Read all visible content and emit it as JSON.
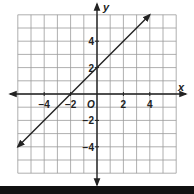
{
  "chart_data": {
    "type": "line",
    "title": "",
    "xlabel": "x",
    "ylabel": "y",
    "xlim": [
      -6,
      6
    ],
    "ylim": [
      -6,
      6
    ],
    "grid": true,
    "origin_label": "O",
    "x_ticks": [
      -4,
      -2,
      2,
      4
    ],
    "y_ticks": [
      4,
      2,
      -2,
      -4
    ],
    "x_tick_labels": [
      "−4",
      "−2",
      "2",
      "4"
    ],
    "y_tick_labels": [
      "4",
      "2",
      "−2",
      "−4"
    ],
    "series": [
      {
        "name": "y = x + 2",
        "slope": 1,
        "intercept": 2,
        "x": [
          -6,
          4
        ],
        "y": [
          -4,
          6
        ],
        "arrows": "both"
      }
    ]
  }
}
